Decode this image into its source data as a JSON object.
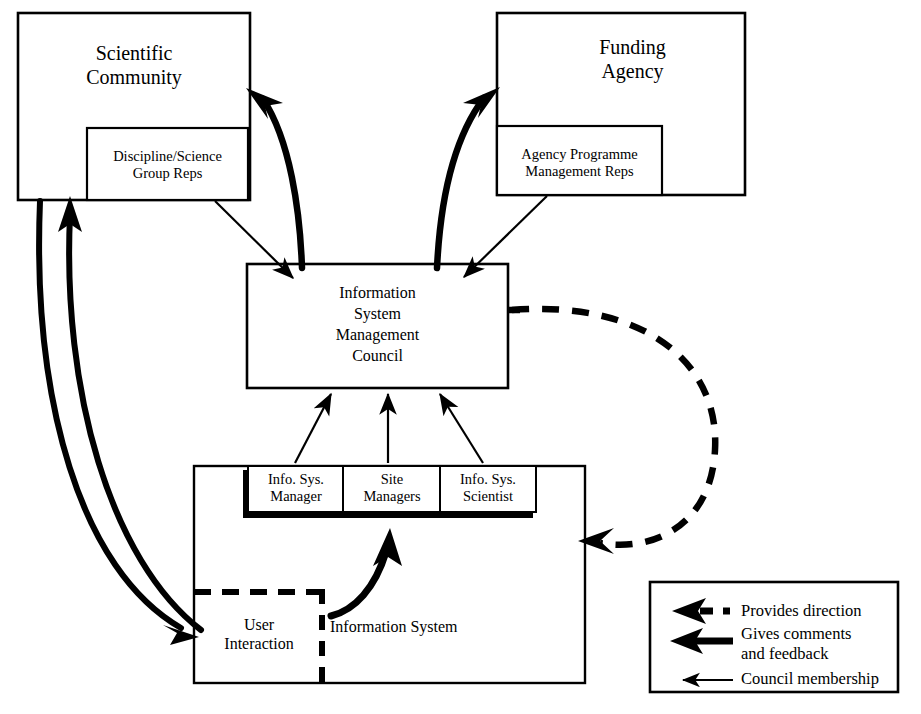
{
  "diagram": {
    "nodes": {
      "scientific_community": {
        "label": "Scientific\nCommunity",
        "sub": {
          "label": "Discipline/Science\nGroup Reps"
        }
      },
      "funding_agency": {
        "label": "Funding\nAgency",
        "sub": {
          "label": "Agency Programme\nManagement Reps"
        }
      },
      "council": {
        "label": "Information\nSystem\nManagement\nCouncil"
      },
      "information_system": {
        "label": "Information System"
      },
      "user_interaction": {
        "label": "User\nInteraction"
      },
      "roles": [
        {
          "label": "Info. Sys.\nManager"
        },
        {
          "label": "Site\nManagers"
        },
        {
          "label": "Info. Sys.\nScientist"
        }
      ]
    },
    "legend": {
      "items": [
        {
          "marker": "dashed-thick-arrow-icon",
          "label": "Provides direction"
        },
        {
          "marker": "solid-thick-arrow-icon",
          "label": "Gives comments\nand feedback"
        },
        {
          "marker": "thin-arrow-icon",
          "label": "Council membership"
        }
      ]
    },
    "colors": {
      "ink": "#000000",
      "paper": "#ffffff"
    }
  }
}
